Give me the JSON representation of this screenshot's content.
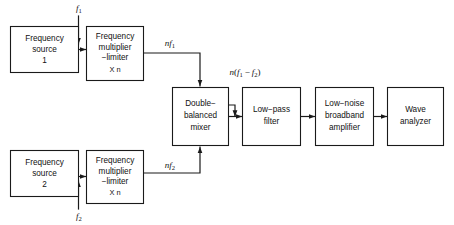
{
  "diagram": {
    "background_color": "#ffffff",
    "line_color": "#1a1a1a",
    "blocks": [
      {
        "id": "freq-source-1",
        "lines": [
          "Frequency",
          "source",
          "1"
        ]
      },
      {
        "id": "freq-multiplier-1",
        "lines": [
          "Frequency",
          "multiplier",
          "−limiter"
        ],
        "sub_line": "X  n"
      },
      {
        "id": "freq-source-2",
        "lines": [
          "Frequency",
          "source",
          "2"
        ]
      },
      {
        "id": "freq-multiplier-2",
        "lines": [
          "Frequency",
          "multiplier",
          "−limiter"
        ],
        "sub_line": "X  n"
      },
      {
        "id": "double-balanced-mixer",
        "lines": [
          "Double−",
          "balanced",
          "mixer"
        ]
      },
      {
        "id": "low-pass-filter",
        "lines": [
          "Low−pass",
          "filter"
        ]
      },
      {
        "id": "low-noise-broadband-amplifier",
        "lines": [
          "Low−noise",
          "broadband",
          "amplifier"
        ]
      },
      {
        "id": "wave-analyzer",
        "lines": [
          "Wave",
          "analyzer"
        ]
      }
    ],
    "signal_labels": [
      {
        "id": "f1",
        "base": "f",
        "sub": "1"
      },
      {
        "id": "nf1",
        "prefix": "n",
        "base": "f",
        "sub": "1"
      },
      {
        "id": "f2",
        "base": "f",
        "sub": "2"
      },
      {
        "id": "nf2",
        "prefix": "n",
        "base": "f",
        "sub": "2"
      },
      {
        "id": "n-f1-minus-f2",
        "prefix": "n",
        "open": "(",
        "base1": "f",
        "sub1": "1",
        "minus": "−",
        "base2": "f",
        "sub2": "2",
        "close": ")"
      }
    ]
  }
}
